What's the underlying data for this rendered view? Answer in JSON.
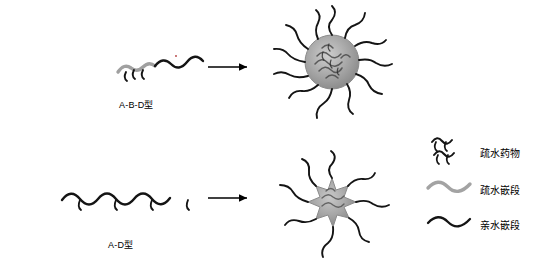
{
  "figure": {
    "type": "schematic-diagram",
    "background": "#ffffff",
    "width": 537,
    "height": 261
  },
  "rows": [
    {
      "id": "row-abd",
      "polymer_label": "A-B-D型",
      "arrow": "→",
      "micelle": "spherical-micelle-with-drug-core"
    },
    {
      "id": "row-ad",
      "polymer_label": "A-D型",
      "arrow": "→",
      "micelle": "star-micelle-with-drug-core"
    }
  ],
  "legend": {
    "items": [
      {
        "key": "drug",
        "label": "疏水药物",
        "glyph": "short-wavy-segments",
        "color": "#1a1a1a"
      },
      {
        "key": "hydrophobic",
        "label": "疏水嵌段",
        "glyph": "thick-gray-wave",
        "color": "#9a9a9a"
      },
      {
        "key": "hydrophilic",
        "label": "亲水嵌段",
        "glyph": "thin-black-wave",
        "color": "#1a1a1a"
      }
    ]
  },
  "colors": {
    "core_fill": "#a8a8a8",
    "core_stroke": "#6f6f6f",
    "chain_black": "#111111",
    "chain_gray": "#9e9e9e",
    "arrow": "#000000"
  }
}
